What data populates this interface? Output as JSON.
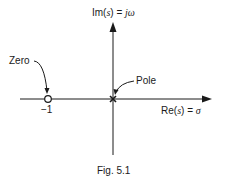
{
  "diagram": {
    "type": "s-plane pole-zero plot",
    "axes": {
      "imag_label_prefix": "Im(",
      "imag_label_var": "s",
      "imag_label_suffix": ") = ",
      "imag_label_rhs": "jω",
      "real_label_prefix": "Re(",
      "real_label_var": "s",
      "real_label_suffix": ") = ",
      "real_label_rhs": "σ"
    },
    "zero": {
      "label": "Zero",
      "value": -1,
      "tick_label": "−1"
    },
    "pole": {
      "label": "Pole",
      "value": 0
    },
    "caption": "Fig. 5.1"
  }
}
